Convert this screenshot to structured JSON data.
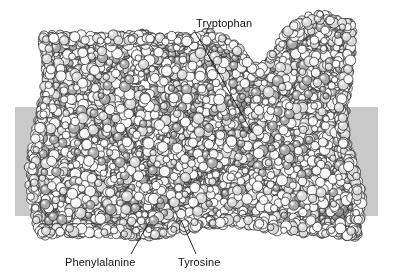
{
  "figure": {
    "width": 393,
    "height": 280,
    "background_color": "#ffffff"
  },
  "membrane": {
    "name": "lipid-bilayer-band",
    "color": "#c9c9c9",
    "left": 15,
    "top": 107,
    "width": 363,
    "height": 109
  },
  "protein": {
    "name": "space-filling-protein-model",
    "representation": "space-filling",
    "palette": {
      "outline": "#2b2b2b",
      "atom_light": "#f7f7f7",
      "atom_mid": "#d8d8d8",
      "atom_dark": "#a8a8a8",
      "atom_darker": "#8c8c8c",
      "halo": "#ffffff"
    }
  },
  "annotations": [
    {
      "id": "tryptophan",
      "label": "Tryptophan",
      "text_x": 196,
      "text_y": 17,
      "leader": {
        "x1": 194,
        "y1": 30,
        "x2": 252,
        "y2": 132
      }
    },
    {
      "id": "phenylalanine",
      "label": "Phenylalanine",
      "text_x": 65,
      "text_y": 256,
      "leader": {
        "x1": 131,
        "y1": 254,
        "x2": 149,
        "y2": 222
      }
    },
    {
      "id": "tyrosine",
      "label": "Tyrosine",
      "text_x": 178,
      "text_y": 256,
      "leader": {
        "x1": 196,
        "y1": 254,
        "x2": 181,
        "y2": 220
      }
    }
  ]
}
